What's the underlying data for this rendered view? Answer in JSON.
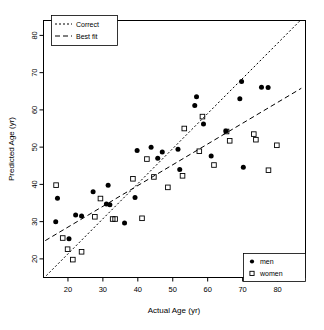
{
  "chart_data": {
    "type": "scatter",
    "title": "",
    "xlabel": "Actual Age (yr)",
    "ylabel": "Predicted Age (yr)",
    "xlim": [
      13,
      88
    ],
    "ylim": [
      15,
      84
    ],
    "xticks": [
      20,
      30,
      40,
      50,
      60,
      70,
      80
    ],
    "yticks": [
      20,
      30,
      40,
      50,
      60,
      70,
      80
    ],
    "grid": false,
    "series": [
      {
        "name": "men",
        "marker": "filled-circle",
        "color": "#000000",
        "points": [
          [
            16.5,
            30.0
          ],
          [
            17.0,
            36.3
          ],
          [
            20.3,
            25.4
          ],
          [
            22.2,
            31.8
          ],
          [
            23.9,
            31.5
          ],
          [
            27.2,
            38.0
          ],
          [
            31.0,
            34.7
          ],
          [
            32.0,
            34.5
          ],
          [
            31.5,
            39.8
          ],
          [
            36.2,
            29.6
          ],
          [
            39.2,
            36.5
          ],
          [
            39.8,
            49.1
          ],
          [
            43.8,
            50.0
          ],
          [
            45.7,
            47.0
          ],
          [
            47.0,
            48.7
          ],
          [
            51.5,
            49.4
          ],
          [
            52.0,
            44.0
          ],
          [
            56.3,
            61.2
          ],
          [
            56.8,
            63.5
          ],
          [
            58.8,
            56.2
          ],
          [
            61.0,
            47.6
          ],
          [
            65.2,
            54.3
          ],
          [
            69.2,
            63.0
          ],
          [
            69.7,
            67.6
          ],
          [
            70.2,
            44.6
          ],
          [
            75.4,
            66.1
          ],
          [
            77.3,
            66.0
          ]
        ]
      },
      {
        "name": "women",
        "marker": "open-square",
        "color": "#000000",
        "points": [
          [
            16.6,
            39.8
          ],
          [
            18.5,
            25.6
          ],
          [
            19.9,
            22.6
          ],
          [
            21.4,
            19.8
          ],
          [
            23.9,
            21.9
          ],
          [
            27.7,
            31.3
          ],
          [
            29.3,
            36.2
          ],
          [
            32.8,
            30.7
          ],
          [
            33.5,
            30.7
          ],
          [
            38.6,
            41.5
          ],
          [
            41.2,
            30.9
          ],
          [
            42.6,
            46.8
          ],
          [
            44.6,
            42.0
          ],
          [
            48.6,
            39.2
          ],
          [
            52.8,
            42.3
          ],
          [
            53.3,
            55.0
          ],
          [
            57.6,
            48.9
          ],
          [
            58.5,
            58.2
          ],
          [
            61.8,
            45.2
          ],
          [
            65.4,
            54.2
          ],
          [
            66.3,
            51.7
          ],
          [
            73.2,
            53.5
          ],
          [
            73.8,
            52.0
          ],
          [
            77.4,
            43.8
          ],
          [
            79.8,
            50.5
          ]
        ]
      }
    ],
    "reference_lines": [
      {
        "name": "Correct",
        "style": "dotted",
        "description": "identity line y = x",
        "x1": 13.8,
        "y1": 15.5,
        "x2": 86.5,
        "y2": 84.0
      },
      {
        "name": "Best fit",
        "style": "dashed",
        "description": "regression line through data",
        "x1": 13.5,
        "y1": 24.9,
        "x2": 86.8,
        "y2": 65.8
      }
    ]
  },
  "legend_lines": {
    "title": "",
    "items": [
      {
        "label": "Correct",
        "style": "dotted"
      },
      {
        "label": "Best fit",
        "style": "dashed"
      }
    ]
  },
  "legend_groups": {
    "title": "",
    "items": [
      {
        "label": "men",
        "marker": "filled-circle"
      },
      {
        "label": "women",
        "marker": "open-square"
      }
    ]
  },
  "axes": {
    "x": {
      "title": "Actual Age (yr)",
      "tick_labels": [
        "20",
        "30",
        "40",
        "50",
        "60",
        "70",
        "80"
      ]
    },
    "y": {
      "title": "Predicted Age (yr)",
      "tick_labels": [
        "20",
        "30",
        "40",
        "50",
        "60",
        "70",
        "80"
      ]
    }
  }
}
